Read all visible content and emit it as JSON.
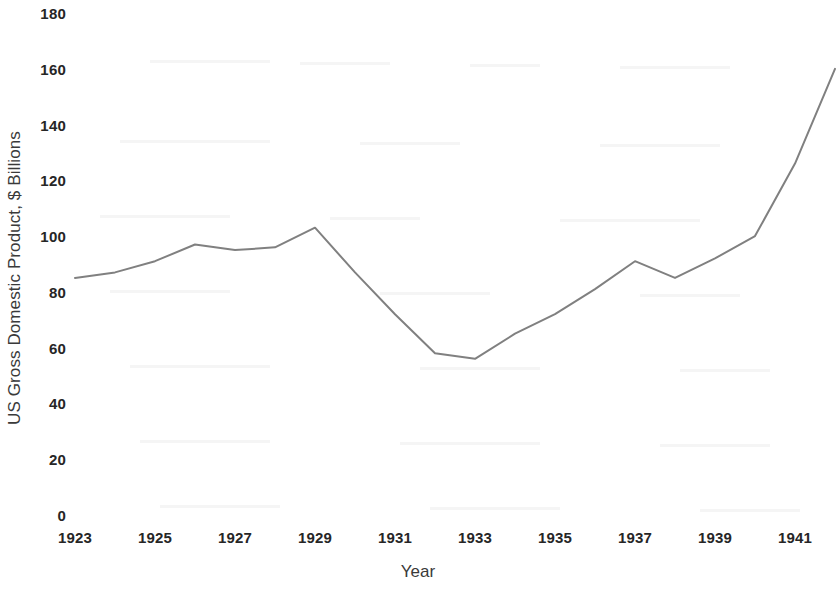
{
  "chart_data": {
    "type": "line",
    "title": "",
    "xlabel": "Year",
    "ylabel": "US Gross Domestic Product, $ Billions",
    "x": [
      1923,
      1924,
      1925,
      1926,
      1927,
      1928,
      1929,
      1930,
      1931,
      1932,
      1933,
      1934,
      1935,
      1936,
      1937,
      1938,
      1939,
      1940,
      1941,
      1942
    ],
    "values": [
      85,
      87,
      91,
      97,
      95,
      96,
      103,
      87,
      72,
      58,
      56,
      65,
      72,
      81,
      91,
      85,
      92,
      100,
      126,
      160
    ],
    "series": [
      {
        "name": "US Gross Domestic Product",
        "values": [
          85,
          87,
          91,
          97,
          95,
          96,
          103,
          87,
          72,
          58,
          56,
          65,
          72,
          81,
          91,
          85,
          92,
          100,
          126,
          160
        ]
      }
    ],
    "xlim": [
      1923,
      1942
    ],
    "ylim": [
      0,
      180
    ],
    "ytick_labels": [
      "0",
      "20",
      "40",
      "60",
      "80",
      "100",
      "120",
      "140",
      "160",
      "180"
    ],
    "ytick_values": [
      0,
      20,
      40,
      60,
      80,
      100,
      120,
      140,
      160,
      180
    ],
    "xtick_labels": [
      "1923",
      "1925",
      "1927",
      "1929",
      "1931",
      "1933",
      "1935",
      "1937",
      "1939",
      "1941"
    ],
    "xtick_values": [
      1923,
      1925,
      1927,
      1929,
      1931,
      1933,
      1935,
      1937,
      1939,
      1941
    ],
    "grid": false,
    "legend": "none",
    "line_color": "#808080",
    "line_width": 2,
    "markers": false,
    "background_color": "#ffffff",
    "tick_label_color": "#262626",
    "axis_title_color": "#3a3a3a"
  }
}
